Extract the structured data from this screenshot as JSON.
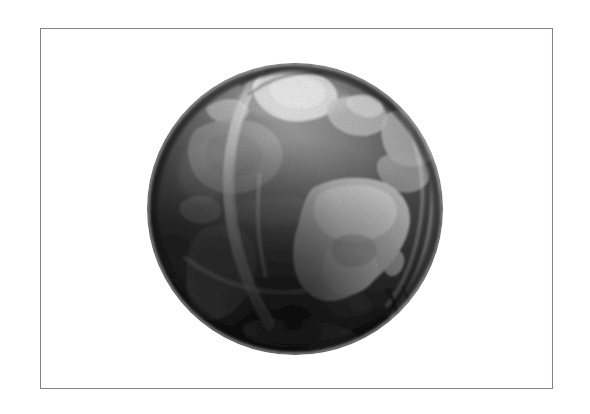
{
  "page": {
    "background_color": "#ffffff",
    "width": 590,
    "height": 414
  },
  "figure": {
    "frame_border_color": "#848484",
    "frame_fill_color": "#ffffff",
    "caption": ""
  },
  "globe": {
    "name": "earth-globe",
    "center_x": 151,
    "center_y": 148,
    "radius": 147,
    "rendering": "grayscale halftone",
    "ocean_color": "#5b5b5b",
    "ocean_dark_color": "#2c2c2c",
    "land_color": "#b9b9b9",
    "land_bright_color": "#d8d8d8",
    "terminator_color": "#141414",
    "arc_color": "#cfcfcf",
    "features": [
      {
        "name": "greenland",
        "label": "Greenland ice sheet",
        "tone": "#d6d6d6"
      },
      {
        "name": "north-america",
        "label": "North America",
        "tone": "#9d9d9d"
      },
      {
        "name": "africa",
        "label": "Africa",
        "tone": "#cccccc"
      },
      {
        "name": "south-america",
        "label": "South America",
        "tone": "#8a8a8a"
      },
      {
        "name": "europe",
        "label": "Europe",
        "tone": "#a8a8a8"
      },
      {
        "name": "atlantic-ocean",
        "label": "Atlantic Ocean",
        "tone": "#4d4d4d"
      },
      {
        "name": "antarctic-shadow",
        "label": "Southern limb shadow",
        "tone": "#1b1b1b"
      }
    ],
    "arcs": [
      {
        "name": "left-meridian-arc",
        "label": "Bright meridian arc (left)"
      },
      {
        "name": "right-limb-arc",
        "label": "Bright limb arc (right)"
      },
      {
        "name": "equator-arc",
        "label": "Equatorial band"
      }
    ]
  },
  "colors": {
    "accent": "#848484",
    "page_white": "#ffffff",
    "deep_shadow": "#0d0d0d"
  }
}
